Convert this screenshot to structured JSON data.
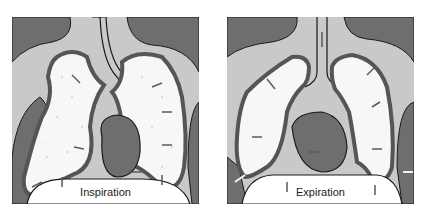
{
  "figure": {
    "panels": [
      {
        "id": "inspiration",
        "label": "Inspiration"
      },
      {
        "id": "expiration",
        "label": "Expiration"
      }
    ],
    "colors": {
      "background": "#ffffff",
      "pleura_light": "#c9c9c9",
      "tissue_dark": "#6e6e6e",
      "lung_fill": "#f7f7f7",
      "wall": "#555555",
      "outline": "#1a1a1a",
      "arrow_dark": "#5a5a5a",
      "arrow_light": "#f2f2f2"
    }
  }
}
